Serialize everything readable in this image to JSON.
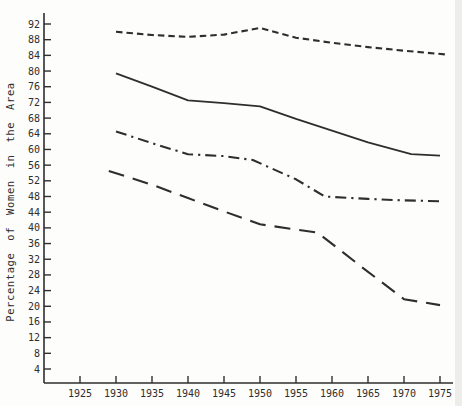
{
  "page": {
    "background": "#fdfdfc"
  },
  "chart_data": {
    "type": "line",
    "title": "",
    "xlabel": "",
    "ylabel": "Percentage of Women in the Area",
    "x_ticks": [
      1925,
      1930,
      1935,
      1940,
      1945,
      1950,
      1955,
      1960,
      1965,
      1970,
      1975
    ],
    "y_ticks": [
      92,
      88,
      84,
      80,
      76,
      72,
      68,
      64,
      60,
      56,
      52,
      48,
      44,
      40,
      36,
      32,
      28,
      24,
      20,
      16,
      12,
      8,
      4
    ],
    "xlim": [
      1920,
      1977
    ],
    "ylim": [
      0,
      95
    ],
    "grid": false,
    "legend_position": "none",
    "axis_color": "#2e2e2e",
    "line_color": "#2e2e2e",
    "series": [
      {
        "name": "top-short-dash-line",
        "style": "short-dash",
        "x": [
          1930,
          1935,
          1940,
          1945,
          1950,
          1955,
          1960,
          1965,
          1970,
          1976
        ],
        "y": [
          90,
          89.2,
          88.7,
          89.3,
          91,
          88.5,
          87.2,
          86.1,
          85.2,
          84.2
        ]
      },
      {
        "name": "solid-line",
        "style": "solid",
        "x": [
          1930,
          1935,
          1940,
          1945,
          1950,
          1955,
          1960,
          1965,
          1971,
          1975
        ],
        "y": [
          79.4,
          76,
          72.5,
          71.8,
          71,
          67.8,
          64.8,
          61.8,
          58.8,
          58.4
        ]
      },
      {
        "name": "dash-dot-line",
        "style": "dash-dot",
        "x": [
          1930,
          1935,
          1940,
          1945,
          1949,
          1955,
          1959,
          1965,
          1970,
          1975
        ],
        "y": [
          64.6,
          61.6,
          58.8,
          58.3,
          57.3,
          52.4,
          48,
          47.4,
          47,
          46.8
        ]
      },
      {
        "name": "bottom-long-dash-line",
        "style": "long-dash",
        "x": [
          1929,
          1935,
          1940,
          1945,
          1950,
          1958,
          1964,
          1970,
          1975
        ],
        "y": [
          54.5,
          51,
          47.6,
          44.2,
          40.9,
          38.8,
          30.2,
          21.8,
          20.3
        ]
      }
    ]
  }
}
